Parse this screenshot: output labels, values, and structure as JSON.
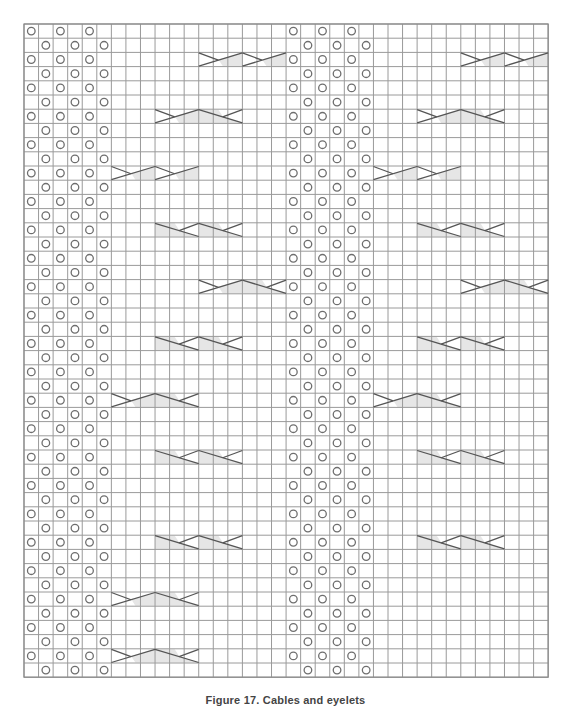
{
  "figure": {
    "caption": "Figure 17. Cables and eyelets",
    "grid": {
      "columns": 36,
      "rows": 46,
      "left": 24,
      "top": 24,
      "cell_width": 14.56,
      "cell_height": 14.2
    },
    "colors": {
      "grid_line": "#9a9a9a",
      "border": "#8a8a8a",
      "eyelet": "#6e6e6e",
      "cable_line": "#555555",
      "cable_fill": "#e6e6e6",
      "background": "#ffffff"
    },
    "legend_symbols": [
      {
        "name": "eyelet",
        "icon": "circle-icon"
      },
      {
        "name": "cable-right-twist",
        "icon": "cable-rt-icon"
      },
      {
        "name": "cable-left-twist",
        "icon": "cable-lt-icon"
      }
    ],
    "eyelet_panels": [
      {
        "name": "left-eyelet-panel",
        "even_row_cols": [
          0,
          2,
          4
        ],
        "odd_row_cols": [
          1,
          3,
          5
        ]
      },
      {
        "name": "right-eyelet-panel",
        "even_row_cols": [
          18,
          20,
          22
        ],
        "odd_row_cols": [
          19,
          21,
          23
        ]
      }
    ],
    "cables": [
      {
        "row": 2,
        "col": 12,
        "types": [
          "RT",
          "RT"
        ]
      },
      {
        "row": 6,
        "col": 9,
        "types": [
          "RT",
          "LT"
        ]
      },
      {
        "row": 10,
        "col": 6,
        "types": [
          "RT",
          "RT"
        ]
      },
      {
        "row": 14,
        "col": 9,
        "types": [
          "LT",
          "LT"
        ]
      },
      {
        "row": 18,
        "col": 12,
        "types": [
          "RT",
          "LT"
        ]
      },
      {
        "row": 22,
        "col": 9,
        "types": [
          "LT",
          "LT"
        ]
      },
      {
        "row": 26,
        "col": 6,
        "types": [
          "RT",
          "LT"
        ]
      },
      {
        "row": 30,
        "col": 9,
        "types": [
          "LT",
          "LT"
        ]
      },
      {
        "row": 36,
        "col": 9,
        "types": [
          "LT",
          "LT"
        ]
      },
      {
        "row": 40,
        "col": 6,
        "types": [
          "RT",
          "LT"
        ]
      },
      {
        "row": 44,
        "col": 6,
        "types": [
          "RT",
          "LT"
        ]
      },
      {
        "row": 2,
        "col": 30,
        "types": [
          "RT",
          "RT"
        ]
      },
      {
        "row": 6,
        "col": 27,
        "types": [
          "RT",
          "LT"
        ]
      },
      {
        "row": 10,
        "col": 24,
        "types": [
          "RT",
          "RT"
        ]
      },
      {
        "row": 14,
        "col": 27,
        "types": [
          "LT",
          "LT"
        ]
      },
      {
        "row": 18,
        "col": 30,
        "types": [
          "RT",
          "LT"
        ]
      },
      {
        "row": 22,
        "col": 27,
        "types": [
          "LT",
          "LT"
        ]
      },
      {
        "row": 26,
        "col": 24,
        "types": [
          "RT",
          "LT"
        ]
      },
      {
        "row": 30,
        "col": 27,
        "types": [
          "LT",
          "LT"
        ]
      },
      {
        "row": 36,
        "col": 27,
        "types": [
          "LT",
          "LT"
        ]
      }
    ]
  }
}
